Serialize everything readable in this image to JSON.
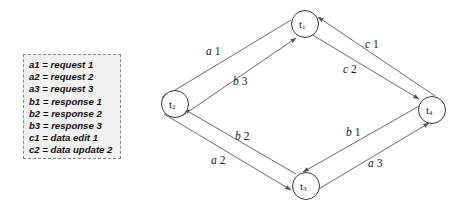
{
  "legend": {
    "items": [
      {
        "key": "a1",
        "value": "request 1",
        "text": "a1 = request 1"
      },
      {
        "key": "a2",
        "value": "request 2",
        "text": "a2 = request 2"
      },
      {
        "key": "a3",
        "value": "request 3",
        "text": "a3 = request 3"
      },
      {
        "key": "b1",
        "value": "response 1",
        "text": "b1 = response 1"
      },
      {
        "key": "b2",
        "value": "response 2",
        "text": "b2 = response 2"
      },
      {
        "key": "b3",
        "value": "response 3",
        "text": "b3 = response 3"
      },
      {
        "key": "c1",
        "value": "data edit 1",
        "text": "c1 = data edit 1"
      },
      {
        "key": "c2",
        "value": "data update 2",
        "text": "c2 = data update 2"
      }
    ]
  },
  "nodes": [
    {
      "id": "t1",
      "label": "t",
      "sub": "1",
      "cx": 305,
      "cy": 24
    },
    {
      "id": "t2",
      "label": "t",
      "sub": "2",
      "cx": 175,
      "cy": 104
    },
    {
      "id": "t3",
      "label": "t",
      "sub": "3",
      "cx": 306,
      "cy": 186
    },
    {
      "id": "t4",
      "label": "t",
      "sub": "4",
      "cx": 432,
      "cy": 110
    }
  ],
  "edges": [
    {
      "id": "a1",
      "var": "a",
      "num": "1",
      "from": "t1",
      "to": "t2"
    },
    {
      "id": "b3",
      "var": "b",
      "num": "3",
      "from": "t2",
      "to": "t1"
    },
    {
      "id": "c1",
      "var": "c",
      "num": "1",
      "from": "t4",
      "to": "t1"
    },
    {
      "id": "c2",
      "var": "c",
      "num": "2",
      "from": "t1",
      "to": "t4"
    },
    {
      "id": "b2",
      "var": "b",
      "num": "2",
      "from": "t3",
      "to": "t2"
    },
    {
      "id": "a2",
      "var": "a",
      "num": "2",
      "from": "t2",
      "to": "t3"
    },
    {
      "id": "b1",
      "var": "b",
      "num": "1",
      "from": "t4",
      "to": "t3"
    },
    {
      "id": "a3",
      "var": "a",
      "num": "3",
      "from": "t3",
      "to": "t4"
    }
  ],
  "colors": {
    "legend_bg": "#f1f1f1",
    "line": "#5a5a5a",
    "node_stroke": "#3a3a3a"
  }
}
